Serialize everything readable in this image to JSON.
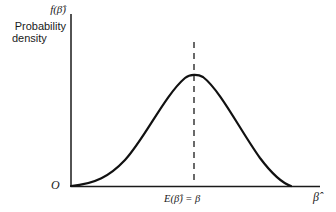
{
  "diagram": {
    "type": "probability-density-curve",
    "y_axis": {
      "function_label": "f(β̂)",
      "title_line1": "Probability",
      "title_line2": "density"
    },
    "x_axis": {
      "label": "β̂",
      "origin_label": "O"
    },
    "mean_marker": {
      "label": "E(β̂) = β",
      "style": "dashed"
    },
    "curve": {
      "shape": "bell",
      "color": "#111111"
    }
  }
}
